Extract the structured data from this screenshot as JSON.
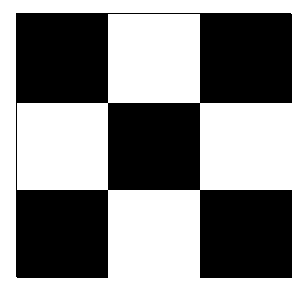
{
  "pattern": {
    "type": "checkerboard",
    "rows": 3,
    "cols": 3,
    "colors": {
      "dark": "#000000",
      "light": "#ffffff"
    },
    "cells": [
      [
        "black",
        "white",
        "black"
      ],
      [
        "white",
        "black",
        "white"
      ],
      [
        "black",
        "white",
        "black"
      ]
    ]
  }
}
